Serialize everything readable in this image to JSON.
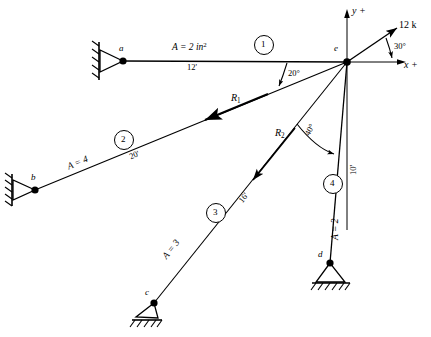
{
  "figure": {
    "stroke_color": "#000000",
    "background": "#ffffff"
  },
  "axes": {
    "y_label": "y +",
    "x_label": "x +",
    "origin_joint": "e"
  },
  "joints": [
    {
      "id": "a",
      "label": "a",
      "x": 123,
      "y": 61,
      "support": "pin"
    },
    {
      "id": "b",
      "label": "b",
      "x": 35,
      "y": 190,
      "support": "pin"
    },
    {
      "id": "c",
      "label": "c",
      "x": 154,
      "y": 303,
      "support": "pin"
    },
    {
      "id": "d",
      "label": "d",
      "x": 330,
      "y": 263,
      "support": "pin"
    },
    {
      "id": "e",
      "label": "e",
      "x": 347,
      "y": 62,
      "support": "none"
    }
  ],
  "members": [
    {
      "number": "1",
      "from": "a",
      "to": "e",
      "area": "A = 2 in",
      "area_sup": "2",
      "length": "12'"
    },
    {
      "number": "2",
      "from": "b",
      "to": "e",
      "area": "A = 4",
      "area_sup": "",
      "length": "20'"
    },
    {
      "number": "3",
      "from": "c",
      "to": "e",
      "area": "A = 3",
      "area_sup": "",
      "length": "16'"
    },
    {
      "number": "4",
      "from": "d",
      "to": "e",
      "area": "A = 2",
      "area_sup": "",
      "length": "10'"
    }
  ],
  "loads": [
    {
      "name": "applied-load",
      "label": "12 k",
      "angle": "30°",
      "at_joint": "e"
    }
  ],
  "reactions": [
    {
      "name": "R1",
      "label": "R",
      "sub": "1",
      "along_member": "2"
    },
    {
      "name": "R2",
      "label": "R",
      "sub": "2",
      "along_member": "3"
    }
  ],
  "angles": [
    {
      "name": "angle-member2",
      "label": "20°",
      "between": "member-1 and member-2"
    },
    {
      "name": "angle-member3",
      "label": "40°",
      "between": "member-3 and member-4"
    },
    {
      "name": "angle-load",
      "label": "30°",
      "between": "x-axis and 12 k load"
    }
  ]
}
